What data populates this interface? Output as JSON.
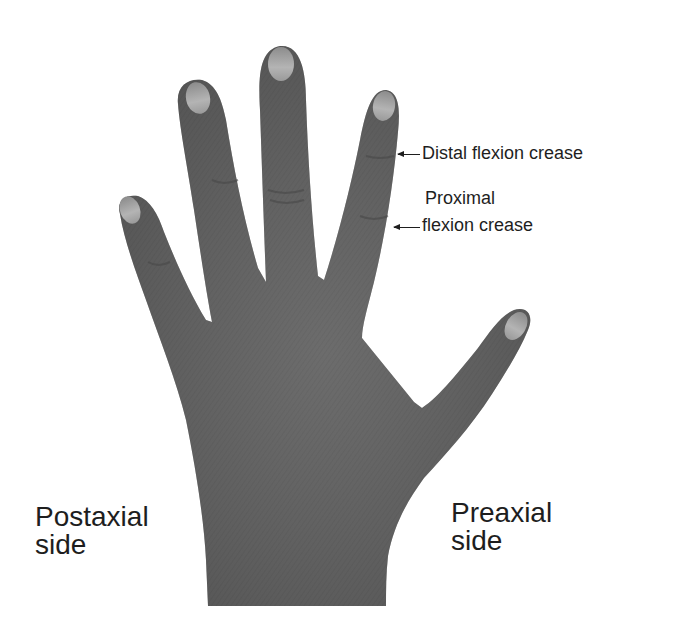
{
  "figure": {
    "colors": {
      "background": "#ffffff",
      "skin": "#6a6a6a",
      "skin_dark": "#4e4e4e",
      "nail": "#a8a8a8",
      "text": "#1e1e1e"
    }
  },
  "labels": {
    "distal_crease": "Distal flexion crease",
    "proximal_crease_line1": "Proximal",
    "proximal_crease_line2": "flexion crease",
    "postaxial_line1": "Postaxial",
    "postaxial_line2": "side",
    "preaxial_line1": "Preaxial",
    "preaxial_line2": "side"
  }
}
